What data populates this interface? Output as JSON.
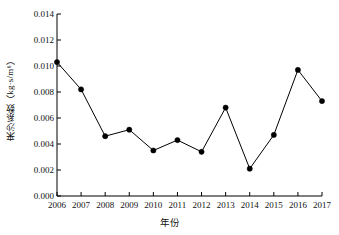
{
  "chart_data": {
    "type": "line",
    "title": "",
    "subtitle": "",
    "xlabel": "年份",
    "ylabel": "来沙系数（kg·s/m⁶）",
    "categories": [
      "2006",
      "2007",
      "2008",
      "2009",
      "2010",
      "2011",
      "2012",
      "2013",
      "2014",
      "2015",
      "2016",
      "2017"
    ],
    "values": [
      0.0103,
      0.0082,
      0.0046,
      0.0051,
      0.0035,
      0.0043,
      0.0034,
      0.0068,
      0.0021,
      0.0047,
      0.0097,
      0.0073
    ],
    "series": [
      {
        "name": "来沙系数",
        "values": [
          0.0103,
          0.0082,
          0.0046,
          0.0051,
          0.0035,
          0.0043,
          0.0034,
          0.0068,
          0.0021,
          0.0047,
          0.0097,
          0.0073
        ]
      }
    ],
    "ylim": [
      0.0,
      0.014
    ],
    "yticks": [
      0.0,
      0.002,
      0.004,
      0.006,
      0.008,
      0.01,
      0.012,
      0.014
    ],
    "ytick_labels": [
      "0.000",
      "0.002",
      "0.004",
      "0.006",
      "0.008",
      "0.010",
      "0.012",
      "0.014"
    ],
    "xtick_labels": [
      "2006",
      "2007",
      "2008",
      "2009",
      "2010",
      "2011",
      "2012",
      "2013",
      "2014",
      "2015",
      "2016",
      "2017"
    ],
    "grid": false,
    "legend": false,
    "legend_position": "none",
    "marker": "circle-filled",
    "line_color": "#000000",
    "marker_color": "#000000",
    "axis_color": "#000000",
    "background_color": "#ffffff"
  }
}
